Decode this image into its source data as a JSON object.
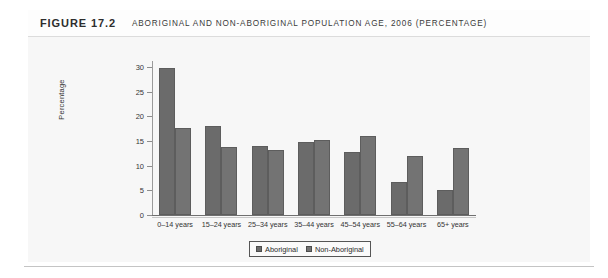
{
  "figure": {
    "number": "FIGURE 17.2",
    "title": "ABORIGINAL AND NON-ABORIGINAL POPULATION AGE, 2006 (PERCENTAGE)"
  },
  "colors": {
    "series_1": "#6b6b6b",
    "series_2": "#737373",
    "axis": "#6f6f6f",
    "plot_background": "#f7f7f7",
    "frame_background": "#fcfcfc"
  },
  "chart_data": {
    "type": "bar",
    "title": "ABORIGINAL AND NON-ABORIGINAL POPULATION AGE, 2006 (PERCENTAGE)",
    "xlabel": "",
    "ylabel": "Percentage",
    "ylim": [
      0,
      30
    ],
    "yticks": [
      0,
      5,
      10,
      15,
      20,
      25,
      30
    ],
    "ytick_labels": [
      "0",
      "5",
      "10",
      "15",
      "20",
      "25",
      "30"
    ],
    "grid": false,
    "legend_position": "bottom-center",
    "categories": [
      "0–14 years",
      "15–24 years",
      "25–34 years",
      "35–44 years",
      "45–54 years",
      "55–64 years",
      "65+ years"
    ],
    "series": [
      {
        "name": "Aboriginal",
        "values": [
          29.9,
          18.0,
          14.0,
          14.8,
          12.8,
          6.7,
          5.1
        ]
      },
      {
        "name": "Non-Aboriginal",
        "values": [
          17.6,
          13.8,
          13.2,
          15.2,
          16.0,
          12.0,
          13.6
        ]
      }
    ]
  }
}
